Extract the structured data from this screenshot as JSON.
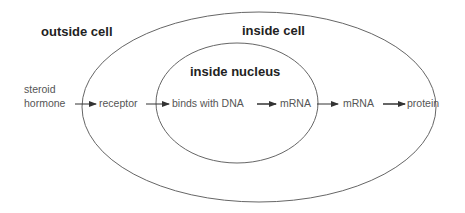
{
  "regions": {
    "outside_cell": "outside cell",
    "inside_cell": "inside cell",
    "inside_nucleus": "inside nucleus"
  },
  "nodes": [
    {
      "line1": "steroid",
      "line2": "hormone"
    },
    {
      "label": "receptor"
    },
    {
      "label": "binds with DNA"
    },
    {
      "label": "mRNA"
    },
    {
      "label": "mRNA"
    },
    {
      "label": "protein"
    }
  ],
  "colors": {
    "outline": "#555555",
    "arrow": "#333333",
    "text": "#555555",
    "region_text": "#222222"
  }
}
